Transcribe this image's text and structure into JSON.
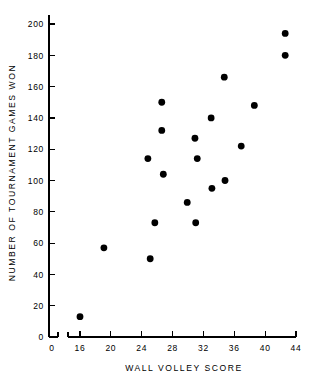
{
  "chart_data": {
    "type": "scatter",
    "title": "",
    "xlabel": "WALL VOLLEY SCORE",
    "ylabel": "NUMBER OF TOURNAMENT GAMES WON",
    "xlim": [
      16,
      44
    ],
    "ylim": [
      0,
      200
    ],
    "grid": false,
    "legend": null,
    "axis_break_x": true,
    "x_origin_label": "0",
    "xticks": [
      16,
      20,
      24,
      28,
      32,
      36,
      40,
      44
    ],
    "xtick_labels": [
      "16",
      "20",
      "24",
      "28",
      "32",
      "36",
      "40",
      "44"
    ],
    "yticks": [
      0,
      20,
      40,
      60,
      80,
      100,
      120,
      140,
      160,
      180,
      200
    ],
    "ytick_labels": [
      "0",
      "20",
      "40",
      "60",
      "80",
      "100",
      "120",
      "140",
      "160",
      "180",
      "200"
    ],
    "marker": "filled-circle",
    "marker_color": "#000000",
    "marker_size": 3.4,
    "points": [
      {
        "x": 16.0,
        "y": 13
      },
      {
        "x": 19.1,
        "y": 57
      },
      {
        "x": 24.8,
        "y": 114
      },
      {
        "x": 25.1,
        "y": 50
      },
      {
        "x": 25.7,
        "y": 73
      },
      {
        "x": 26.6,
        "y": 150
      },
      {
        "x": 26.6,
        "y": 132
      },
      {
        "x": 26.8,
        "y": 104
      },
      {
        "x": 29.9,
        "y": 86
      },
      {
        "x": 30.9,
        "y": 127
      },
      {
        "x": 31.0,
        "y": 73
      },
      {
        "x": 31.2,
        "y": 114
      },
      {
        "x": 33.0,
        "y": 140
      },
      {
        "x": 33.1,
        "y": 95
      },
      {
        "x": 34.7,
        "y": 166
      },
      {
        "x": 34.8,
        "y": 100
      },
      {
        "x": 36.9,
        "y": 122
      },
      {
        "x": 38.6,
        "y": 148
      },
      {
        "x": 42.6,
        "y": 194
      },
      {
        "x": 42.6,
        "y": 180
      }
    ]
  }
}
